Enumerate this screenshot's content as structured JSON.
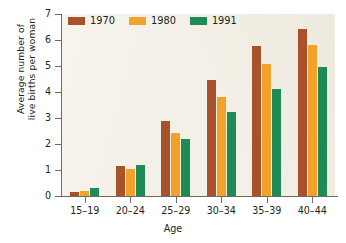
{
  "chart_data": {
    "type": "bar",
    "title": "",
    "xlabel": "Age",
    "ylabel": "Average number of live births per woman",
    "ylabel_lines": [
      "Average number of",
      "live births per woman"
    ],
    "categories": [
      "15–19",
      "20–24",
      "25–29",
      "30–34",
      "35–39",
      "40–44"
    ],
    "ylim": [
      0,
      7
    ],
    "y_ticks": [
      0,
      1,
      2,
      3,
      4,
      5,
      6,
      7
    ],
    "y_tick_labels": [
      "0",
      "1",
      "2",
      "3",
      "4",
      "5",
      "6",
      "7"
    ],
    "grid": false,
    "legend_position": "top-left",
    "series": [
      {
        "name": "1970",
        "color": "#a9512a",
        "values": [
          0.15,
          1.15,
          2.9,
          4.47,
          5.77,
          6.43
        ]
      },
      {
        "name": "1980",
        "color": "#f2a12b",
        "values": [
          0.2,
          1.05,
          2.42,
          3.82,
          5.08,
          5.82
        ]
      },
      {
        "name": "1991",
        "color": "#1e8a56",
        "values": [
          0.3,
          1.18,
          2.2,
          3.22,
          4.13,
          4.98
        ]
      }
    ]
  },
  "colors": {
    "plot_background": "#f3f0e7",
    "axis": "#6d6a64",
    "text": "#231f20",
    "series_1970": "#a9512a",
    "series_1980": "#f2a12b",
    "series_1991": "#1e8a56"
  }
}
